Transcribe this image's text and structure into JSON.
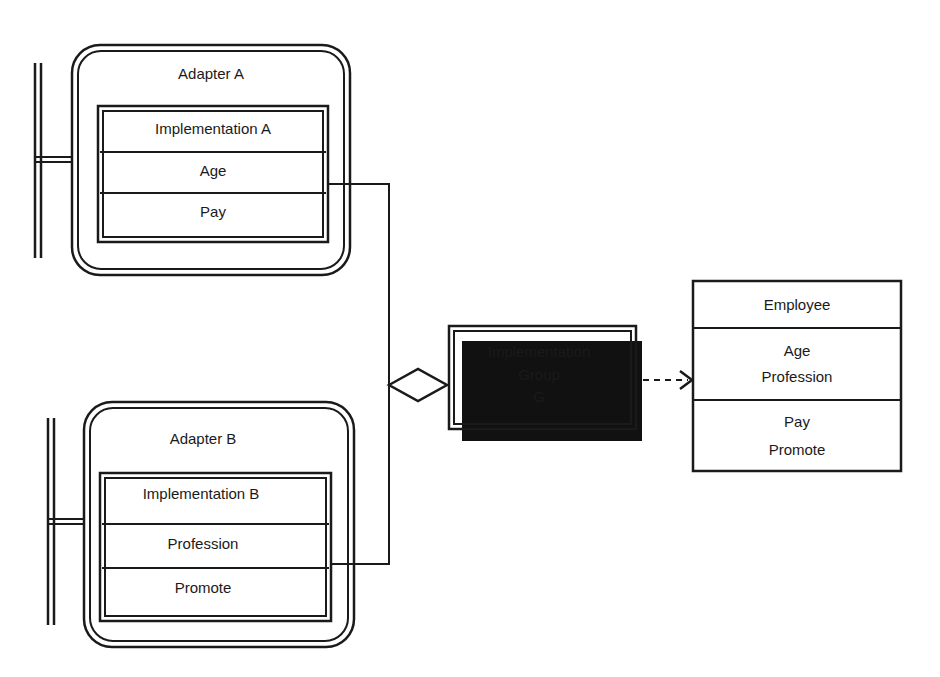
{
  "adapter_a": {
    "title": "Adapter A",
    "implementation": {
      "title": "Implementation A",
      "rows": [
        "Age",
        "Pay"
      ]
    }
  },
  "adapter_b": {
    "title": "Adapter B",
    "implementation": {
      "title": "Implementation B",
      "rows": [
        "Profession",
        "Promote"
      ]
    }
  },
  "group": {
    "lines": [
      "Implementation",
      "Group",
      "G"
    ]
  },
  "employee": {
    "title": "Employee",
    "attributes": [
      "Age",
      "Profession"
    ],
    "operations": [
      "Pay",
      "Promote"
    ]
  },
  "colors": {
    "stroke": "#1a1a1a",
    "background": "#ffffff",
    "shadow": "#111111"
  }
}
